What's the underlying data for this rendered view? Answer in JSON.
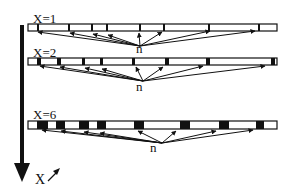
{
  "diagram": {
    "axis_label": "X",
    "colors": {
      "ink": "#111111",
      "bar_fill": "#ffffff",
      "background": "#ffffff"
    },
    "rows": [
      {
        "label": "X=1",
        "pointer_label": "n",
        "bar": {
          "x": 28,
          "y": 24,
          "w": 249,
          "h": 7
        },
        "blocks": [
          [
            37,
            2
          ],
          [
            68,
            2
          ],
          [
            91,
            2
          ],
          [
            106,
            2
          ],
          [
            139,
            2
          ],
          [
            163,
            2
          ],
          [
            208,
            2
          ],
          [
            258,
            2
          ]
        ],
        "label_pos": [
          33,
          12
        ],
        "n_pos": [
          136,
          42
        ],
        "origin": [
          140,
          46
        ],
        "targets": [
          [
            38,
            32
          ],
          [
            70,
            33
          ],
          [
            93,
            34
          ],
          [
            108,
            35
          ],
          [
            139,
            33
          ],
          [
            162,
            32
          ],
          [
            210,
            31
          ],
          [
            255,
            31
          ]
        ]
      },
      {
        "label": "X=2",
        "pointer_label": "n",
        "bar": {
          "x": 28,
          "y": 58,
          "w": 249,
          "h": 7
        },
        "blocks": [
          [
            37,
            4
          ],
          [
            57,
            4
          ],
          [
            82,
            3
          ],
          [
            100,
            3
          ],
          [
            132,
            3
          ],
          [
            165,
            4
          ],
          [
            206,
            4
          ],
          [
            271,
            4
          ]
        ],
        "label_pos": [
          33,
          46
        ],
        "n_pos": [
          136,
          80
        ],
        "origin": [
          143,
          81
        ],
        "targets": [
          [
            40,
            66
          ],
          [
            60,
            67
          ],
          [
            85,
            68
          ],
          [
            102,
            69
          ],
          [
            136,
            67
          ],
          [
            163,
            67
          ],
          [
            203,
            66
          ],
          [
            265,
            66
          ]
        ]
      },
      {
        "label": "X=6",
        "pointer_label": "n",
        "bar": {
          "x": 28,
          "y": 121,
          "w": 249,
          "h": 8
        },
        "blocks": [
          [
            37,
            11
          ],
          [
            56,
            9
          ],
          [
            79,
            10
          ],
          [
            97,
            9
          ],
          [
            134,
            10
          ],
          [
            180,
            10
          ],
          [
            219,
            10
          ],
          [
            256,
            8
          ]
        ],
        "label_pos": [
          33,
          108
        ],
        "n_pos": [
          150,
          141
        ],
        "origin": [
          162,
          143
        ],
        "targets": [
          [
            42,
            130
          ],
          [
            61,
            131
          ],
          [
            84,
            132
          ],
          [
            100,
            133
          ],
          [
            138,
            131
          ],
          [
            176,
            131
          ],
          [
            216,
            131
          ],
          [
            253,
            130
          ]
        ]
      }
    ]
  }
}
